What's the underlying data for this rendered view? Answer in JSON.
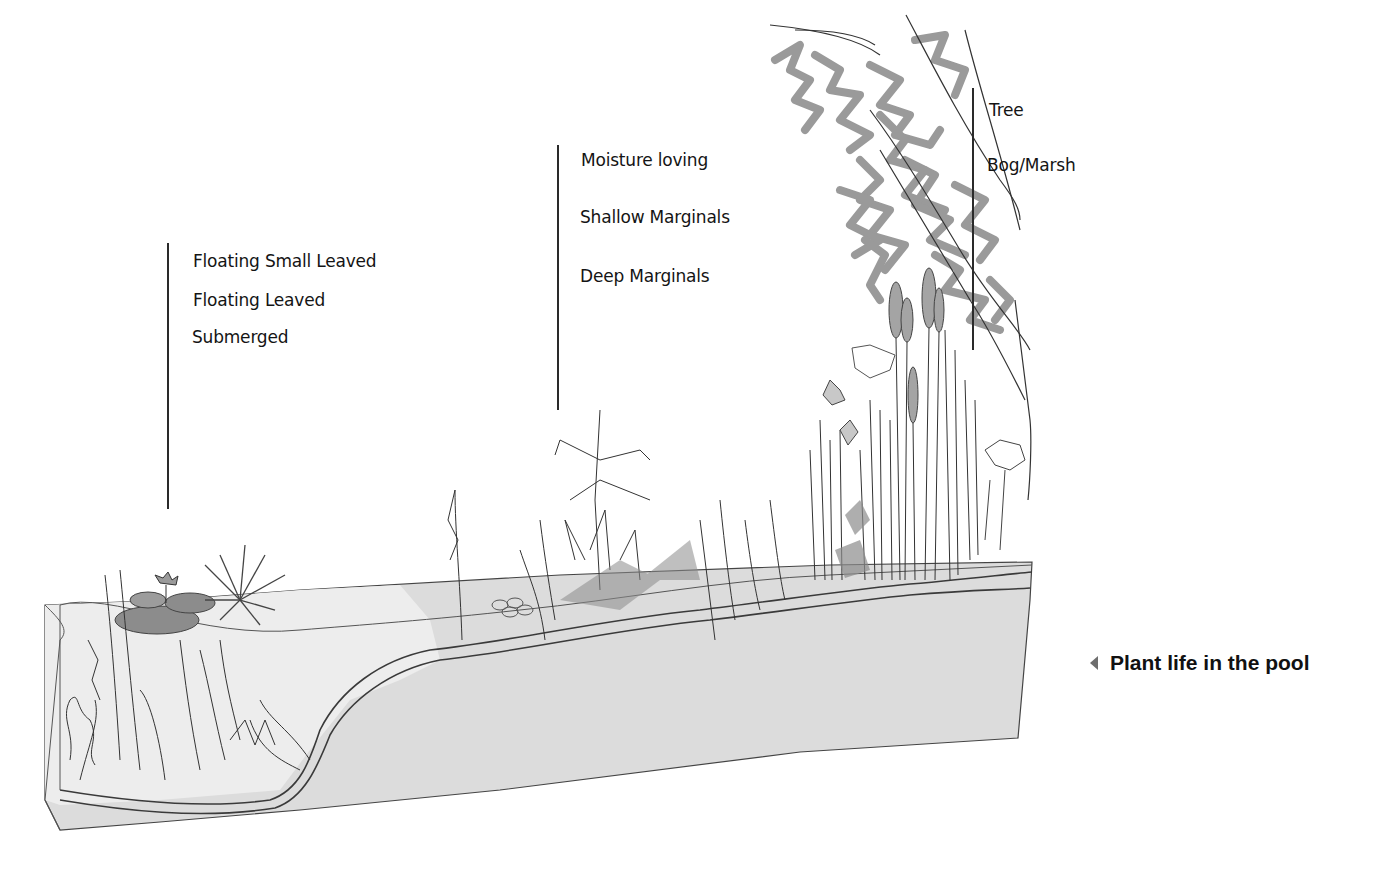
{
  "figure": {
    "caption": "Plant life in the pool",
    "caption_icon": "triangle-left-icon",
    "colors": {
      "ink": "#2a2a2a",
      "tree_gray": "#9a9a9a",
      "water_fill": "#e8e8e8",
      "soil_fill": "#dcdcdc",
      "leaf_gray": "#8c8c8c",
      "caption_arrow": "#6e6e6e"
    }
  },
  "zones": {
    "deep_water": {
      "labels": [
        "Floating Small Leaved",
        "Floating Leaved",
        "Submerged"
      ]
    },
    "margins": {
      "labels": [
        "Moisture loving",
        "Shallow Marginals",
        "Deep Marginals"
      ]
    },
    "bank": {
      "labels": [
        "Tree",
        "Bog/Marsh"
      ]
    }
  }
}
